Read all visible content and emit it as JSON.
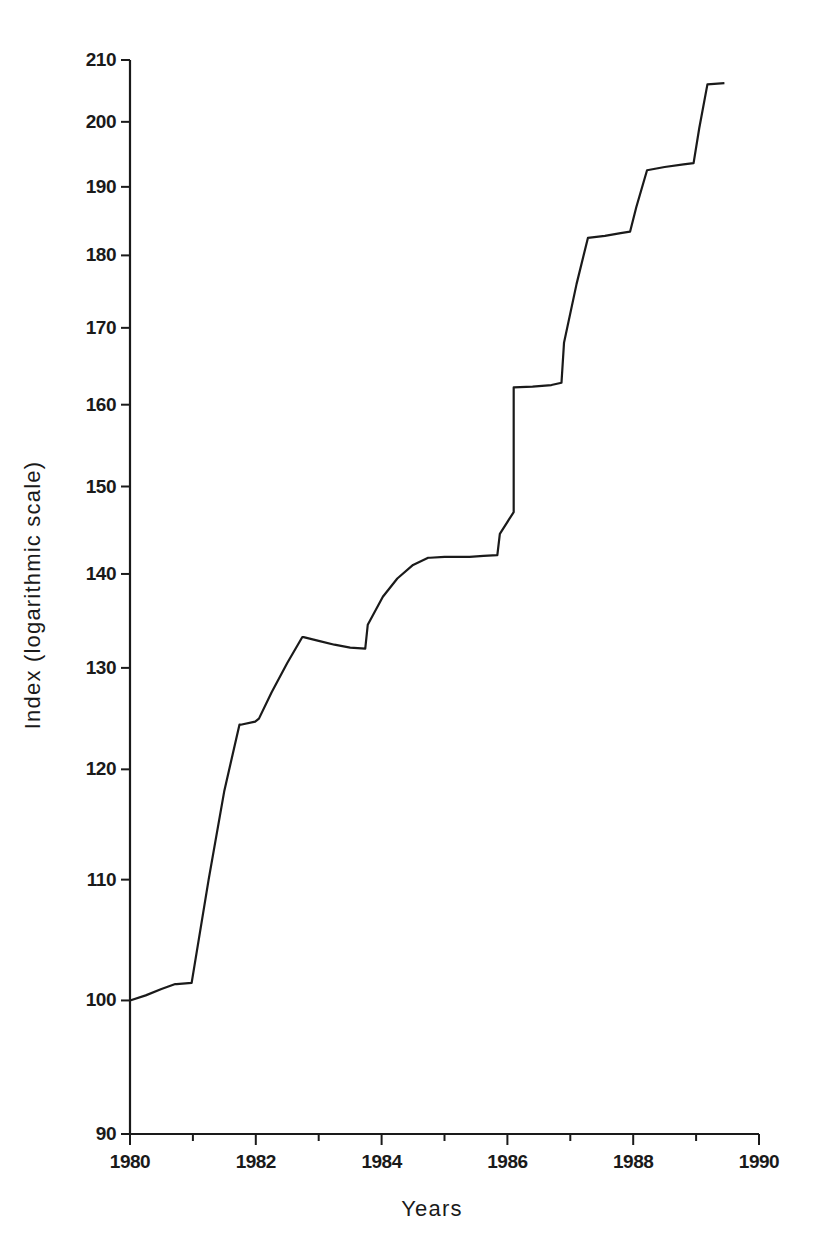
{
  "chart_data": {
    "type": "line",
    "title": "",
    "xlabel": "Years",
    "ylabel": "Index (logarithmic scale)",
    "yscale": "log",
    "ylim": [
      90,
      210
    ],
    "xlim": [
      1980,
      1990
    ],
    "grid": false,
    "legend": null,
    "y_ticks": [
      90,
      100,
      110,
      120,
      130,
      140,
      150,
      160,
      170,
      180,
      190,
      200,
      210
    ],
    "y_tick_labels": [
      "90",
      "100",
      "110",
      "120",
      "130",
      "140",
      "150",
      "160",
      "170",
      "180",
      "190",
      "200",
      "210"
    ],
    "x_ticks_major": [
      1980,
      1982,
      1984,
      1986,
      1988,
      1990
    ],
    "x_tick_labels": [
      "1980",
      "1982",
      "1984",
      "1986",
      "1988",
      "1990"
    ],
    "x_ticks_minor": [
      1981,
      1983,
      1985,
      1987,
      1989
    ],
    "series": [
      {
        "name": "Index",
        "x": [
          1980.0,
          1980.25,
          1980.5,
          1980.72,
          1980.74,
          1980.98,
          1981.25,
          1981.5,
          1981.74,
          1981.76,
          1981.99,
          1982.05,
          1982.25,
          1982.5,
          1982.74,
          1982.76,
          1983.0,
          1983.25,
          1983.5,
          1983.74,
          1983.78,
          1984.02,
          1984.25,
          1984.5,
          1984.74,
          1984.77,
          1985.0,
          1985.18,
          1985.4,
          1985.62,
          1985.84,
          1985.88,
          1986.1,
          1986.35,
          1986.6,
          1986.8,
          1986.84,
          1987.05,
          1987.3,
          1987.6,
          1987.9,
          1987.95,
          1988.2,
          1988.45,
          1988.7,
          1988.88,
          1988.92,
          1989.12,
          1989.3
        ],
        "y": [
          100.0,
          100.4,
          100.9,
          101.3,
          101.3,
          101.4,
          110.0,
          118.0,
          124.3,
          124.3,
          124.6,
          124.9,
          127.5,
          130.5,
          133.2,
          133.2,
          132.8,
          132.4,
          132.1,
          132.0,
          134.5,
          137.5,
          139.5,
          141.0,
          141.8,
          141.8,
          141.9,
          141.9,
          141.9,
          142.0,
          142.1,
          144.5,
          147.0,
          148.4,
          148.5,
          148.6,
          148.6,
          150.5,
          152.8,
          154.4,
          154.2,
          153.7,
          153.2,
          153.0,
          153.0,
          153.0,
          157.0,
          160.5,
          162.2
        ]
      }
    ],
    "series_full": {
      "description": "Staircase-like index rising from 100 in 1980 to about 206 in mid-1989 on a logarithmic scale",
      "start_value": 100,
      "end_value": 206,
      "plateaus": [
        {
          "year_range": "1980.0-1980.9",
          "value": 101.3
        },
        {
          "year_range": "1981.0-1981.9",
          "value": 124.5
        },
        {
          "year_range": "1982.0-1983.0",
          "value": 132.5
        },
        {
          "year_range": "1984.0-1985.0",
          "value": 141.9
        },
        {
          "year_range": "1985.2-1986.0",
          "value": 148.5
        },
        {
          "year_range": "1985.5-1986.0",
          "value": 153.1
        },
        {
          "year_range": "1986.2-1987.0",
          "value": 162.5
        },
        {
          "year_range": "1987.0-1988.0",
          "value": 183.0
        },
        {
          "year_range": "1988.0-1989.0",
          "value": 193.5
        },
        {
          "year_range": "1989.2-1989.3",
          "value": 206.0
        }
      ]
    }
  },
  "axes": {
    "y_axis_title": "Index (logarithmic scale)",
    "x_axis_title": "Years"
  }
}
